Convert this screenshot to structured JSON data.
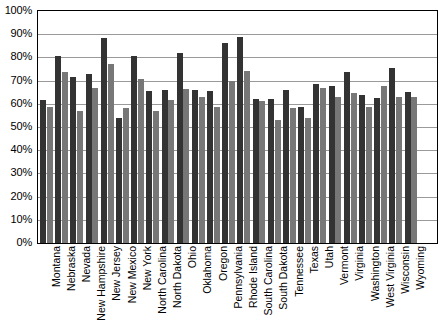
{
  "chart_data": {
    "type": "bar",
    "title": "",
    "subtitle": "",
    "xlabel": "",
    "ylabel": "",
    "ylim": [
      0,
      100
    ],
    "grid": true,
    "legend": "none",
    "y_ticks": [
      "100%",
      "90%",
      "80%",
      "70%",
      "60%",
      "50%",
      "40%",
      "30%",
      "20%",
      "10%",
      "0%"
    ],
    "y_tick_values": [
      100,
      90,
      80,
      70,
      60,
      50,
      40,
      30,
      20,
      10,
      0
    ],
    "categories": [
      "Montana",
      "Nebraska",
      "Nevada",
      "New Hampshire",
      "New Jersey",
      "New Mexico",
      "New York",
      "North Carolina",
      "North Dakota",
      "Ohio",
      "Oklahoma",
      "Oregon",
      "Pennsylvania",
      "Rhode Island",
      "South Carolina",
      "South Dakota",
      "Tennessee",
      "Texas",
      "Utah",
      "Vermont",
      "Virginia",
      "Washington",
      "West Virginia",
      "Wisconsin",
      "Wyoming"
    ],
    "series": [
      {
        "name": "Series 1",
        "color": "#333333",
        "values": [
          61.5,
          80.5,
          71.5,
          73.0,
          88.5,
          54.0,
          80.5,
          65.5,
          66.0,
          82.0,
          66.0,
          65.5,
          86.0,
          89.0,
          62.0,
          62.0,
          66.0,
          58.5,
          68.5,
          67.5,
          73.5,
          64.0,
          62.5,
          75.5,
          65.0
        ]
      },
      {
        "name": "Series 2",
        "color": "#777777",
        "values": [
          58.5,
          73.5,
          57.0,
          67.0,
          77.0,
          58.0,
          70.5,
          57.0,
          61.5,
          66.5,
          63.0,
          58.5,
          70.0,
          74.0,
          61.0,
          53.0,
          58.0,
          54.0,
          67.0,
          63.0,
          64.5,
          58.5,
          67.5,
          63.0,
          63.0
        ]
      }
    ]
  }
}
